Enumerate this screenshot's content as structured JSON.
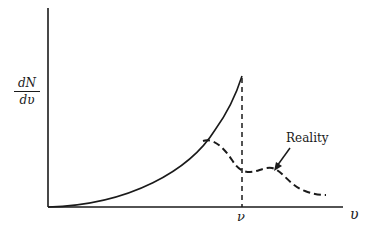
{
  "diagram": {
    "y_axis_label": {
      "numerator": "dN",
      "denominator": "dυ"
    },
    "x_axis_label": "υ",
    "marker_label": "ν",
    "annotation": "Reality",
    "colors": {
      "ink": "#1a1a1a",
      "background": "#ffffff"
    },
    "curves": [
      {
        "name": "theoretical",
        "style": "solid",
        "description": "rises monotonically from origin to cutoff at ν"
      },
      {
        "name": "reality",
        "style": "dashed",
        "description": "departs from theoretical curve, dips near ν, small bump, then decays"
      }
    ],
    "cutoff_line": {
      "style": "dashed",
      "position": "ν"
    }
  }
}
